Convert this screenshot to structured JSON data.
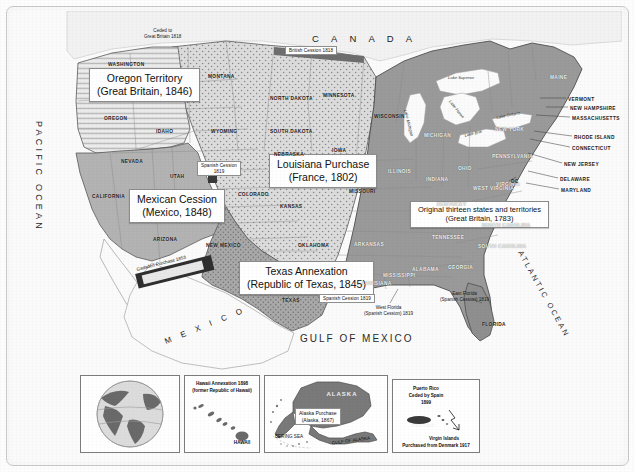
{
  "map": {
    "title_regions": [
      {
        "id": "oregon",
        "line1": "Oregon Territory",
        "line2": "(Great Britain, 1846)"
      },
      {
        "id": "louisiana",
        "line1": "Louisiana Purchase",
        "line2": "(France, 1802)"
      },
      {
        "id": "mexican",
        "line1": "Mexican Cession",
        "line2": "(Mexico, 1848)"
      },
      {
        "id": "texas",
        "line1": "Texas Annexation",
        "line2": "(Republic of Texas, 1845)"
      },
      {
        "id": "original",
        "line1": "Original thirteen states and territories",
        "line2": "(Great Britain, 1783)"
      }
    ],
    "small_labels": {
      "british_cession": "British Cession 1818",
      "ceded_to_britain": "Ceded to\nGreat Britain 1818",
      "spanish_cession_west": "Spanish Cession\n1819",
      "spanish_cession_texas": "Spanish Cession 1819",
      "gadsden": "Gadsden Purchase 1853",
      "west_florida": "West Florida\n(Spanish Cession) 1819",
      "east_florida": "East Florida\n(Spanish Cession) 1819"
    },
    "oceans": {
      "pacific": "PACIFIC OCEAN",
      "atlantic": "ATLANTIC OCEAN",
      "gulf": "GULF OF MEXICO"
    },
    "countries": {
      "canada": "C A N A D A",
      "mexico": "M E X I C O"
    },
    "lakes": [
      "Lake Superior",
      "Lake Michigan",
      "Lake Huron",
      "Lake Erie",
      "Lake Ontario"
    ],
    "states": [
      {
        "name": "WASHINGTON",
        "x": 96,
        "y": 51,
        "light": false
      },
      {
        "name": "OREGON",
        "x": 92,
        "y": 105,
        "light": false
      },
      {
        "name": "IDAHO",
        "x": 144,
        "y": 118,
        "light": false
      },
      {
        "name": "MONTANA",
        "x": 196,
        "y": 63,
        "light": false
      },
      {
        "name": "WYOMING",
        "x": 199,
        "y": 118,
        "light": false
      },
      {
        "name": "NEVADA",
        "x": 109,
        "y": 148,
        "light": false
      },
      {
        "name": "CALIFORNIA",
        "x": 80,
        "y": 183,
        "light": false
      },
      {
        "name": "UTAH",
        "x": 158,
        "y": 163,
        "light": false
      },
      {
        "name": "ARIZONA",
        "x": 141,
        "y": 226,
        "light": false
      },
      {
        "name": "NEW MEXICO",
        "x": 194,
        "y": 232,
        "light": false
      },
      {
        "name": "COLORADO",
        "x": 226,
        "y": 181,
        "light": false
      },
      {
        "name": "NORTH DAKOTA",
        "x": 258,
        "y": 85,
        "light": false
      },
      {
        "name": "SOUTH DAKOTA",
        "x": 258,
        "y": 118,
        "light": false
      },
      {
        "name": "NEBRASKA",
        "x": 262,
        "y": 141,
        "light": false
      },
      {
        "name": "KANSAS",
        "x": 268,
        "y": 193,
        "light": false
      },
      {
        "name": "OKLAHOMA",
        "x": 286,
        "y": 232,
        "light": false
      },
      {
        "name": "TEXAS",
        "x": 270,
        "y": 287,
        "light": false
      },
      {
        "name": "MINNESOTA",
        "x": 311,
        "y": 82,
        "light": false
      },
      {
        "name": "IOWA",
        "x": 320,
        "y": 137,
        "light": false
      },
      {
        "name": "MISSOURI",
        "x": 337,
        "y": 178,
        "light": false
      },
      {
        "name": "ARKANSAS",
        "x": 342,
        "y": 231,
        "light": true
      },
      {
        "name": "LOUISIANA",
        "x": 350,
        "y": 270,
        "light": true
      },
      {
        "name": "MISSISSIPPI",
        "x": 371,
        "y": 262,
        "light": true
      },
      {
        "name": "WISCONSIN",
        "x": 362,
        "y": 103,
        "light": false
      },
      {
        "name": "ILLINOIS",
        "x": 376,
        "y": 158,
        "light": true
      },
      {
        "name": "MICHIGAN",
        "x": 412,
        "y": 122,
        "light": true
      },
      {
        "name": "INDIANA",
        "x": 414,
        "y": 166,
        "light": true
      },
      {
        "name": "OHIO",
        "x": 446,
        "y": 155,
        "light": true
      },
      {
        "name": "KENTUCKY",
        "x": 425,
        "y": 191,
        "light": true
      },
      {
        "name": "TENNESSEE",
        "x": 420,
        "y": 224,
        "light": true
      },
      {
        "name": "ALABAMA",
        "x": 400,
        "y": 256,
        "light": true
      },
      {
        "name": "GEORGIA",
        "x": 436,
        "y": 254,
        "light": true
      },
      {
        "name": "FLORIDA",
        "x": 470,
        "y": 311,
        "light": false
      },
      {
        "name": "SOUTH CAROLINA",
        "x": 466,
        "y": 233,
        "light": true
      },
      {
        "name": "NORTH CAROLINA",
        "x": 470,
        "y": 212,
        "light": true
      },
      {
        "name": "WEST VIRGINIA",
        "x": 461,
        "y": 175,
        "light": true
      },
      {
        "name": "VIRGINIA",
        "x": 484,
        "y": 171,
        "light": true
      },
      {
        "name": "PENNSYLVANIA",
        "x": 480,
        "y": 143,
        "light": true
      },
      {
        "name": "NEW YORK",
        "x": 483,
        "y": 116,
        "light": true
      },
      {
        "name": "MAINE",
        "x": 538,
        "y": 64,
        "light": true
      }
    ],
    "leader_states": [
      {
        "name": "VERMONT",
        "x": 556,
        "y": 86
      },
      {
        "name": "NEW HAMPSHIRE",
        "x": 558,
        "y": 95
      },
      {
        "name": "MASSACHUSETTS",
        "x": 560,
        "y": 105
      },
      {
        "name": "RHODE ISLAND",
        "x": 562,
        "y": 124
      },
      {
        "name": "CONNECTICUT",
        "x": 560,
        "y": 135
      },
      {
        "name": "NEW JERSEY",
        "x": 552,
        "y": 151
      },
      {
        "name": "DELAWARE",
        "x": 548,
        "y": 166
      },
      {
        "name": "MARYLAND",
        "x": 549,
        "y": 177
      },
      {
        "name": "DC",
        "x": 499,
        "y": 168
      }
    ]
  },
  "insets": {
    "globe": {
      "name": "globe-inset"
    },
    "hawaii": {
      "line1": "Hawaii Annexation 1898",
      "line2": "(former Republic of Hawaii)",
      "island": "HAWAII"
    },
    "alaska": {
      "region": "ALASKA",
      "callout_l1": "Alaska Purchase",
      "callout_l2": "(Alaska, 1867)",
      "sea1": "BERING SEA",
      "sea2": "GULF OF ALASKA"
    },
    "caribbean": {
      "pr_l1": "Puerto Rico",
      "pr_l2": "Ceded by Spain",
      "pr_l3": "1899",
      "pr_name": "PUERTO RICO",
      "vi_l1": "Virgin Islands",
      "vi_l2": "Purchased from Denmark 1917"
    }
  },
  "colors": {
    "original13": "#8f8f8f",
    "louisiana": "#d6d6d6",
    "mexican": "#b0b0b0",
    "texas": "#9e9e9e",
    "oregon": "#e2e2e2",
    "water": "#fbfbfb",
    "outline": "#4a4a4a"
  }
}
